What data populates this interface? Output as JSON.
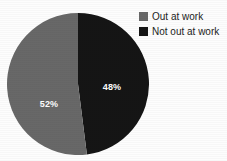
{
  "background_color": "#fdfdfd",
  "chart_data": {
    "type": "pie",
    "title": "",
    "subtitle": "",
    "xlabel": "",
    "ylabel": "",
    "grid": false,
    "legend_position": "top-right",
    "start_angle_deg": 0,
    "direction": "clockwise",
    "categories": [
      "Out at work",
      "Not out at work"
    ],
    "values": [
      52,
      48
    ],
    "value_unit": "%",
    "colors": [
      "#686868",
      "#151515"
    ],
    "slices": [
      {
        "label": "Out at work",
        "value": 52,
        "display_value": "52%",
        "color": "#686868",
        "label_color": "#ffffff"
      },
      {
        "label": "Not out at work",
        "value": 48,
        "display_value": "48%",
        "color": "#151515",
        "label_color": "#ffffff"
      }
    ]
  },
  "legend": {
    "items": [
      {
        "label": "Out at work",
        "color": "#686868"
      },
      {
        "label": "Not out at work",
        "color": "#151515"
      }
    ]
  },
  "labels": {
    "out_at_work_pct": "52%",
    "not_out_at_work_pct": "48%"
  }
}
